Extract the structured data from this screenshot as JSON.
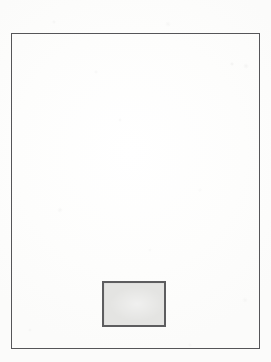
{
  "figure": {
    "kind": "scanned-line-drawing",
    "background_color": "#fdfdfc",
    "has_text": false,
    "caption": "",
    "outer_frame": {
      "name": "outer-frame",
      "shape": "rectangle",
      "stroke_color": "#555558",
      "stroke_width_px": 1,
      "fill": "none",
      "x": 11,
      "y": 33,
      "width": 249,
      "height": 316,
      "label": ""
    },
    "shapes": [
      {
        "name": "shaded-box",
        "shape": "rectangle",
        "stroke_color": "#5d5d5f",
        "stroke_width_px": 2,
        "fill_color": "#e4e4e2",
        "x": 102,
        "y": 281,
        "width": 64,
        "height": 46,
        "label": ""
      }
    ],
    "annotations": []
  },
  "canvas": {
    "width": 271,
    "height": 362
  }
}
